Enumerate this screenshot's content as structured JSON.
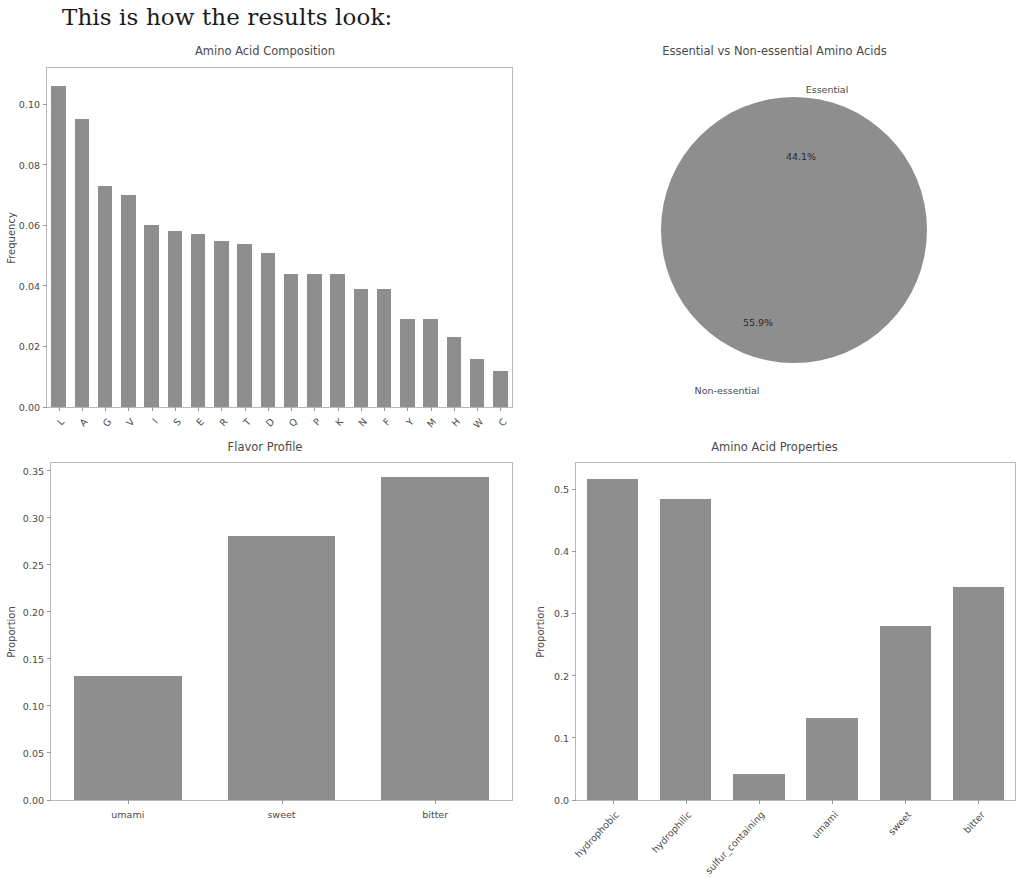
{
  "page": {
    "heading": "This is how the results look:"
  },
  "colors": {
    "bar": "#8e8e8e",
    "pie_essential": "#8e8e8e",
    "pie_non_essential": "#d4d4d4",
    "axis": "#b9b9b9",
    "text": "#4a4a4a"
  },
  "chart_data": [
    {
      "id": "amino-acid-composition",
      "type": "bar",
      "title": "Amino Acid Composition",
      "xlabel": "",
      "ylabel": "Frequency",
      "ylim": [
        0,
        0.112
      ],
      "yticks": [
        "0.00",
        "0.02",
        "0.04",
        "0.06",
        "0.08",
        "0.10"
      ],
      "ytickvals": [
        0.0,
        0.02,
        0.04,
        0.06,
        0.08,
        0.1
      ],
      "grid": false,
      "categories": [
        "L",
        "A",
        "G",
        "V",
        "I",
        "S",
        "E",
        "R",
        "T",
        "D",
        "Q",
        "P",
        "K",
        "N",
        "F",
        "Y",
        "M",
        "H",
        "W",
        "C"
      ],
      "values": [
        0.106,
        0.095,
        0.073,
        0.07,
        0.06,
        0.058,
        0.057,
        0.055,
        0.054,
        0.051,
        0.044,
        0.044,
        0.044,
        0.039,
        0.039,
        0.029,
        0.029,
        0.023,
        0.016,
        0.012
      ]
    },
    {
      "id": "essential-vs-non-essential",
      "type": "pie",
      "title": "Essential vs Non-essential Amino Acids",
      "legend_position": "none",
      "slices": [
        {
          "label": "Essential",
          "value": 44.1,
          "pct_label": "44.1%",
          "color": "#8e8e8e"
        },
        {
          "label": "Non-essential",
          "value": 55.9,
          "pct_label": "55.9%",
          "color": "#d4d4d4"
        }
      ]
    },
    {
      "id": "flavor-profile",
      "type": "bar",
      "title": "Flavor Profile",
      "xlabel": "",
      "ylabel": "Proportion",
      "ylim": [
        0,
        0.358
      ],
      "yticks": [
        "0.00",
        "0.05",
        "0.10",
        "0.15",
        "0.20",
        "0.25",
        "0.30",
        "0.35"
      ],
      "ytickvals": [
        0.0,
        0.05,
        0.1,
        0.15,
        0.2,
        0.25,
        0.3,
        0.35
      ],
      "grid": false,
      "categories": [
        "umami",
        "sweet",
        "bitter"
      ],
      "values": [
        0.132,
        0.28,
        0.343
      ]
    },
    {
      "id": "amino-acid-properties",
      "type": "bar",
      "title": "Amino Acid Properties",
      "xlabel": "",
      "ylabel": "Proportion",
      "ylim": [
        0,
        0.542
      ],
      "yticks": [
        "0.0",
        "0.1",
        "0.2",
        "0.3",
        "0.4",
        "0.5"
      ],
      "ytickvals": [
        0.0,
        0.1,
        0.2,
        0.3,
        0.4,
        0.5
      ],
      "grid": false,
      "categories": [
        "hydrophobic",
        "hydrophilic",
        "sulfur_containing",
        "umami",
        "sweet",
        "bitter"
      ],
      "values": [
        0.516,
        0.484,
        0.042,
        0.132,
        0.28,
        0.343
      ]
    }
  ]
}
